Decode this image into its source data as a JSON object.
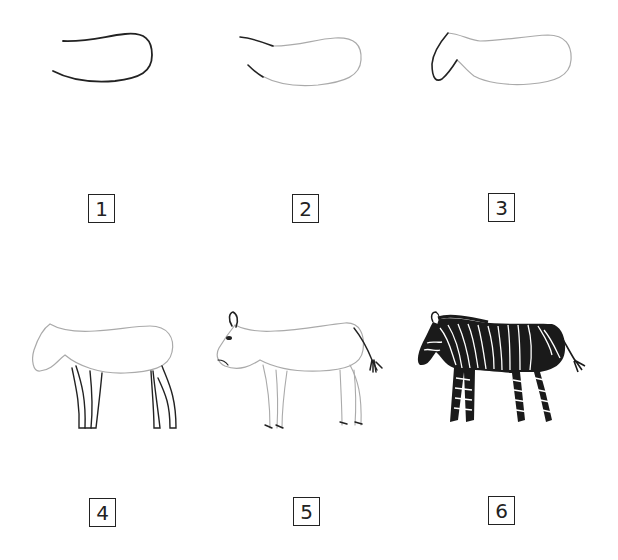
{
  "steps": [
    {
      "number": "1",
      "description": "Back and belly curve of body (first stroke)"
    },
    {
      "number": "2",
      "description": "Neck lines added to body outline"
    },
    {
      "number": "3",
      "description": "Head shape added"
    },
    {
      "number": "4",
      "description": "Four legs added"
    },
    {
      "number": "5",
      "description": "Ear, eye, mouth, tail and hooves added"
    },
    {
      "number": "6",
      "description": "Finished zebra with stripes and mane"
    }
  ],
  "colors": {
    "ink": "#222222",
    "light_ink": "#9a9a9a",
    "paper": "#ffffff"
  }
}
